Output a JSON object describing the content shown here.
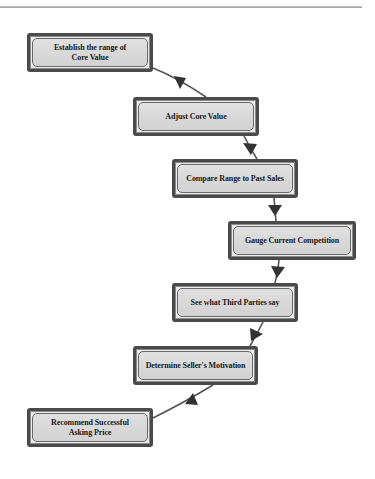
{
  "diagram": {
    "type": "flowchart",
    "steps": [
      {
        "id": 1,
        "label": "Establish the range of\nCore Value"
      },
      {
        "id": 2,
        "label": "Adjust Core Value"
      },
      {
        "id": 3,
        "label": "Compare Range to Past Sales"
      },
      {
        "id": 4,
        "label": "Gauge Current Competition"
      },
      {
        "id": 5,
        "label": "See what Third Parties say"
      },
      {
        "id": 6,
        "label": "Determine Seller's Motivation"
      },
      {
        "id": 7,
        "label": "Recommend Successful\nAsking Price"
      }
    ],
    "edges": [
      {
        "from": 1,
        "to": 2
      },
      {
        "from": 2,
        "to": 3
      },
      {
        "from": 3,
        "to": 4
      },
      {
        "from": 4,
        "to": 5
      },
      {
        "from": 5,
        "to": 6
      },
      {
        "from": 6,
        "to": 7
      }
    ],
    "colors": {
      "box_border": "#4a4a4a",
      "box_fill": "#d8d8d8",
      "connector": "#555555",
      "arrowhead": "#333333",
      "text": "#1a1a1a"
    }
  }
}
